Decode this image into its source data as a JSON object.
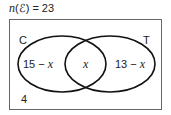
{
  "title": {
    "func": "n",
    "set_symbol": "(ℰ)",
    "rest": " = 23"
  },
  "venn": {
    "universal_total": 23,
    "sets": [
      {
        "name": "C",
        "label": "C"
      },
      {
        "name": "T",
        "label": "T"
      }
    ],
    "regions": {
      "c_only": {
        "num": "15 − ",
        "var": "x"
      },
      "intersection": {
        "var": "x"
      },
      "t_only": {
        "num": "13 − ",
        "var": "x"
      },
      "outside": "4"
    },
    "colors": {
      "stroke": "#111111",
      "border": "#666666",
      "text": "#222222"
    }
  }
}
